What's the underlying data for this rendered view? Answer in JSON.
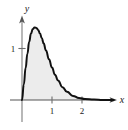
{
  "figure": {
    "background_color": "#ffffff",
    "curve_color": "#111111",
    "axis_color": "#6e6e6e",
    "fill_color": "#ececec"
  },
  "chart_data": {
    "type": "area",
    "title": "",
    "subtitle": "",
    "xlabel": "x",
    "ylabel": "y",
    "xlim": [
      -0.15,
      3.2
    ],
    "ylim": [
      -0.35,
      1.75
    ],
    "grid": false,
    "legend": null,
    "annotations": [],
    "x_ticks": [
      1,
      2
    ],
    "x_tick_labels": [
      "1",
      "2"
    ],
    "y_ticks": [
      1
    ],
    "y_tick_labels": [
      "1"
    ],
    "shaded_region": {
      "label": "",
      "from_x": 0,
      "to_x": 3.05,
      "fill": "#ececec"
    },
    "series": [
      {
        "name": "density curve",
        "x": [
          0.0,
          0.06,
          0.12,
          0.18,
          0.24,
          0.3,
          0.36,
          0.42,
          0.48,
          0.54,
          0.6,
          0.66,
          0.72,
          0.8,
          0.9,
          1.0,
          1.1,
          1.2,
          1.35,
          1.5,
          1.7,
          1.9,
          2.1,
          2.4,
          2.7,
          3.05
        ],
        "y": [
          0.0,
          0.3,
          0.62,
          0.9,
          1.13,
          1.29,
          1.38,
          1.41,
          1.4,
          1.36,
          1.29,
          1.2,
          1.1,
          0.96,
          0.79,
          0.63,
          0.49,
          0.38,
          0.25,
          0.16,
          0.08,
          0.04,
          0.02,
          0.01,
          0.0,
          0.0
        ]
      }
    ]
  },
  "axes": {
    "y_axis_arrow": "up-arrow",
    "x_axis_arrow": "right-arrow"
  }
}
